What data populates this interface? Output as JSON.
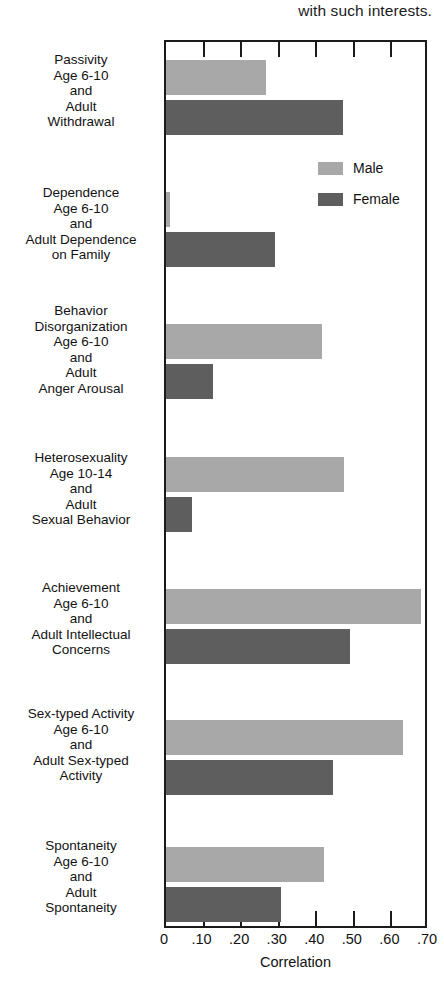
{
  "caption": {
    "text": "with such interests."
  },
  "chart_data": {
    "type": "bar",
    "orientation": "horizontal",
    "title": "",
    "xlabel": "Correlation",
    "ylabel": "",
    "xlim": [
      0,
      0.7
    ],
    "xticks": [
      0,
      0.1,
      0.2,
      0.3,
      0.4,
      0.5,
      0.6,
      0.7
    ],
    "xticklabels": [
      "0",
      ".10",
      ".20",
      ".30",
      ".40",
      ".50",
      ".60",
      ".70"
    ],
    "grid": false,
    "legend_position": "inside-upper-right",
    "categories": [
      "Passivity Age 6-10 and Adult Withdrawal",
      "Dependence Age 6-10 and Adult Dependence on Family",
      "Behavior Disorganization Age 6-10 and Adult Anger Arousal",
      "Heterosexuality Age 10-14 and Adult Sexual Behavior",
      "Achievement Age 6-10 and Adult Intellectual Concerns",
      "Sex-typed Activity Age 6-10 and Adult Sex-typed Activity",
      "Spontaneity Age 6-10 and Adult Spontaneity"
    ],
    "category_label_lines": [
      [
        "Passivity",
        "Age 6-10",
        "and",
        "Adult",
        "Withdrawal"
      ],
      [
        "Dependence",
        "Age 6-10",
        "and",
        "Adult Dependence",
        "on Family"
      ],
      [
        "Behavior",
        "Disorganization",
        "Age 6-10",
        "and",
        "Adult",
        "Anger Arousal"
      ],
      [
        "Heterosexuality",
        "Age 10-14",
        "and",
        "Adult",
        "Sexual Behavior"
      ],
      [
        "Achievement",
        "Age 6-10",
        "and",
        "Adult Intellectual",
        "Concerns"
      ],
      [
        "Sex-typed Activity",
        "Age 6-10",
        "and",
        "Adult Sex-typed",
        "Activity"
      ],
      [
        "Spontaneity",
        "Age 6-10",
        "and",
        "Adult",
        "Spontaneity"
      ]
    ],
    "series": [
      {
        "name": "Male",
        "color": "#a8a8a8",
        "values": [
          0.265,
          0.01,
          0.415,
          0.475,
          0.68,
          0.63,
          0.42
        ]
      },
      {
        "name": "Female",
        "color": "#5e5e5e",
        "values": [
          0.47,
          0.29,
          0.125,
          0.07,
          0.49,
          0.445,
          0.305
        ]
      }
    ]
  },
  "legend": {
    "items": [
      {
        "label": "Male",
        "color": "#a8a8a8"
      },
      {
        "label": "Female",
        "color": "#5e5e5e"
      }
    ]
  },
  "layout": {
    "frame": {
      "left": 164,
      "top": 40,
      "width": 263,
      "height": 888
    },
    "group_tops": [
      58,
      190,
      322,
      455,
      587,
      718,
      845
    ],
    "bar_height": 35,
    "bar_gap": 5,
    "label_tops": [
      52,
      185,
      303,
      450,
      580,
      706,
      838
    ]
  }
}
